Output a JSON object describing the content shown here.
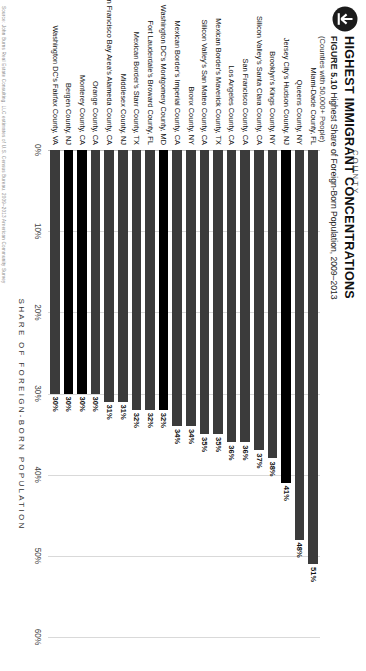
{
  "figure": {
    "download_icon": "download-arrow-icon",
    "title": "HIGHEST IMMIGRANT CONCENTRATIONS",
    "figure_number": "FIGURE 5.10",
    "subtitle": "Highest Share of Foreign-Born Population, 2009–2013",
    "note": "(Counties with 50,000+ People)",
    "column_header": "COUNTY",
    "source": "Source: John Burns Real Estate Consulting, LLC estimates of U.S. Census Bureau, 2009–2013 American Community Survey"
  },
  "colors": {
    "bar": "#3b3b3b",
    "bar_highlight": "#000000",
    "grid": "#d9d9d9",
    "text": "#111111"
  },
  "chart_data": {
    "type": "bar",
    "orientation": "horizontal",
    "title": "HIGHEST IMMIGRANT CONCENTRATIONS",
    "subtitle": "Highest Share of Foreign-Born Population, 2009–2013",
    "xlabel": "SHARE OF FOREIGN-BORN POPULATION",
    "ylabel": "COUNTY",
    "xlim": [
      0,
      60
    ],
    "xticks": [
      0,
      10,
      20,
      30,
      40,
      50,
      60
    ],
    "xtick_labels": [
      "0%",
      "10%",
      "20%",
      "30%",
      "40%",
      "50%",
      "60%"
    ],
    "grid": true,
    "legend": "none",
    "value_suffix": "%",
    "categories": [
      "Miami-Dade County, FL",
      "Queens County, NY",
      "Jersey City's Hudson County, NJ",
      "Brooklyn's Kings County, NY",
      "Silicon Valley's Santa Clara County, CA",
      "San Francisco County, CA",
      "Los Angeles County, CA",
      "Mexican Border's Maverick County, TX",
      "Silicon Valley's San Mateo County, CA",
      "Bronx County, NY",
      "Mexican Border's Imperial County, CA",
      "Washington DC's Montgomery County, MD",
      "Fort Lauderdale's Broward County, FL",
      "Mexican Border's Starr County, TX",
      "Middlesex County, NJ",
      "San Francisco Bay Area's Alameda County, CA",
      "Orange County, CA",
      "Monterey County, CA",
      "Bergen County, NJ",
      "Washington DC's Fairfax County, VA"
    ],
    "values": [
      51,
      48,
      41,
      38,
      37,
      36,
      36,
      35,
      35,
      34,
      34,
      32,
      32,
      32,
      31,
      31,
      30,
      30,
      30,
      30
    ],
    "value_labels": [
      "51%",
      "48%",
      "41%",
      "38%",
      "37%",
      "36%",
      "36%",
      "35%",
      "35%",
      "34%",
      "34%",
      "32%",
      "32%",
      "32%",
      "31%",
      "31%",
      "30%",
      "30%",
      "30%",
      "30%"
    ],
    "highlighted": [
      false,
      false,
      true,
      false,
      false,
      false,
      false,
      false,
      false,
      false,
      false,
      true,
      false,
      false,
      false,
      false,
      false,
      true,
      true,
      false
    ]
  }
}
